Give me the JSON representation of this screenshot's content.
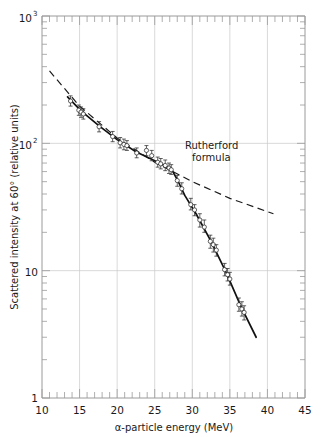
{
  "chart_data": {
    "type": "scatter",
    "title": "",
    "xlabel": "α-particle energy (MeV)",
    "ylabel": "Scattered intensity at 60° (relative units)",
    "xlim": [
      10,
      45
    ],
    "ylim": [
      1,
      1000
    ],
    "yscale": "log",
    "xscale": "linear",
    "grid": true,
    "legend_position": "none",
    "xticks": [
      10,
      15,
      20,
      25,
      30,
      35,
      40,
      45
    ],
    "xtick_labels": [
      "10",
      "15",
      "20",
      "25",
      "30",
      "35",
      "40",
      "45"
    ],
    "xminor_step": 1,
    "yticks": [
      1,
      10,
      100,
      1000
    ],
    "ytick_labels": [
      "1",
      "10",
      "10",
      "10"
    ],
    "ytick_label_parts": [
      {
        "base": "1",
        "exp": ""
      },
      {
        "base": "10",
        "exp": ""
      },
      {
        "base": "10",
        "exp": "2"
      },
      {
        "base": "10",
        "exp": "3"
      }
    ],
    "annotations": [
      {
        "name": "rutherford-formula-label",
        "text_line1": "Rutherford",
        "text_line2": "formula",
        "x": 25.6,
        "y": 78
      }
    ],
    "series": [
      {
        "name": "measured scattered intensity",
        "style": "points-with-errorbars-and-line",
        "marker": "open-circle",
        "color": "#111111",
        "points": [
          {
            "x": 13.8,
            "y": 215,
            "yerr_lo": 196,
            "yerr_hi": 236
          },
          {
            "x": 14.9,
            "y": 182,
            "yerr_lo": 166,
            "yerr_hi": 200
          },
          {
            "x": 15.2,
            "y": 176,
            "yerr_lo": 160,
            "yerr_hi": 193
          },
          {
            "x": 15.5,
            "y": 170,
            "yerr_lo": 155,
            "yerr_hi": 187
          },
          {
            "x": 17.6,
            "y": 135,
            "yerr_lo": 123,
            "yerr_hi": 148
          },
          {
            "x": 19.4,
            "y": 113,
            "yerr_lo": 103,
            "yerr_hi": 124
          },
          {
            "x": 20.4,
            "y": 101,
            "yerr_lo": 92,
            "yerr_hi": 111
          },
          {
            "x": 20.9,
            "y": 98,
            "yerr_lo": 89,
            "yerr_hi": 108
          },
          {
            "x": 21.3,
            "y": 96,
            "yerr_lo": 88,
            "yerr_hi": 105
          },
          {
            "x": 22.6,
            "y": 84,
            "yerr_lo": 77,
            "yerr_hi": 92
          },
          {
            "x": 23.9,
            "y": 88,
            "yerr_lo": 80,
            "yerr_hi": 96
          },
          {
            "x": 24.6,
            "y": 80,
            "yerr_lo": 73,
            "yerr_hi": 88
          },
          {
            "x": 25.4,
            "y": 71,
            "yerr_lo": 65,
            "yerr_hi": 78
          },
          {
            "x": 25.8,
            "y": 69,
            "yerr_lo": 63,
            "yerr_hi": 76
          },
          {
            "x": 26.4,
            "y": 67,
            "yerr_lo": 61,
            "yerr_hi": 74
          },
          {
            "x": 26.9,
            "y": 64,
            "yerr_lo": 58,
            "yerr_hi": 70
          },
          {
            "x": 27.2,
            "y": 62,
            "yerr_lo": 57,
            "yerr_hi": 68
          },
          {
            "x": 28.0,
            "y": 51,
            "yerr_lo": 46,
            "yerr_hi": 56
          },
          {
            "x": 28.6,
            "y": 44,
            "yerr_lo": 40,
            "yerr_hi": 49
          },
          {
            "x": 29.8,
            "y": 33,
            "yerr_lo": 30,
            "yerr_hi": 37
          },
          {
            "x": 30.3,
            "y": 30,
            "yerr_lo": 27,
            "yerr_hi": 33
          },
          {
            "x": 31.0,
            "y": 25,
            "yerr_lo": 22,
            "yerr_hi": 28
          },
          {
            "x": 31.6,
            "y": 22,
            "yerr_lo": 20,
            "yerr_hi": 25
          },
          {
            "x": 32.4,
            "y": 17,
            "yerr_lo": 15,
            "yerr_hi": 19
          },
          {
            "x": 32.8,
            "y": 16,
            "yerr_lo": 14,
            "yerr_hi": 18
          },
          {
            "x": 33.2,
            "y": 14.5,
            "yerr_lo": 13,
            "yerr_hi": 16
          },
          {
            "x": 34.3,
            "y": 10.2,
            "yerr_lo": 9.1,
            "yerr_hi": 11.4
          },
          {
            "x": 34.7,
            "y": 9.3,
            "yerr_lo": 8.3,
            "yerr_hi": 10.4
          },
          {
            "x": 35.0,
            "y": 8.6,
            "yerr_lo": 7.7,
            "yerr_hi": 9.7
          },
          {
            "x": 36.2,
            "y": 5.4,
            "yerr_lo": 4.8,
            "yerr_hi": 6.1
          },
          {
            "x": 36.6,
            "y": 5.0,
            "yerr_lo": 4.4,
            "yerr_hi": 5.7
          },
          {
            "x": 36.9,
            "y": 4.7,
            "yerr_lo": 4.1,
            "yerr_hi": 5.3
          }
        ],
        "fit_line": [
          {
            "x": 13.4,
            "y": 232
          },
          {
            "x": 15.2,
            "y": 180
          },
          {
            "x": 17.6,
            "y": 137
          },
          {
            "x": 20.0,
            "y": 107
          },
          {
            "x": 22.5,
            "y": 86
          },
          {
            "x": 25.0,
            "y": 73
          },
          {
            "x": 27.2,
            "y": 63
          },
          {
            "x": 28.0,
            "y": 52
          },
          {
            "x": 29.0,
            "y": 39
          },
          {
            "x": 30.5,
            "y": 28
          },
          {
            "x": 32.5,
            "y": 17
          },
          {
            "x": 34.5,
            "y": 9.7
          },
          {
            "x": 36.5,
            "y": 5.2
          },
          {
            "x": 38.5,
            "y": 3.0
          }
        ]
      },
      {
        "name": "Rutherford formula",
        "style": "dashed-line",
        "color": "#1a1a1a",
        "points": [
          {
            "x": 11.0,
            "y": 370
          },
          {
            "x": 15.0,
            "y": 196
          },
          {
            "x": 20.0,
            "y": 110
          },
          {
            "x": 25.0,
            "y": 71
          },
          {
            "x": 27.2,
            "y": 61
          },
          {
            "x": 30.0,
            "y": 50
          },
          {
            "x": 35.0,
            "y": 37
          },
          {
            "x": 40.8,
            "y": 28
          }
        ]
      }
    ]
  },
  "labels": {
    "ylabel": "Scattered intensity at 60° (relative units)",
    "xlabel_prefix": "α",
    "xlabel_rest": "-particle energy (MeV)",
    "annotation_line1": "Rutherford",
    "annotation_line2": "formula",
    "y_1": "1",
    "y_10": "10",
    "y_100_base": "10",
    "y_100_exp": "2",
    "y_1000_base": "10",
    "y_1000_exp": "3",
    "x_10": "10",
    "x_15": "15",
    "x_20": "20",
    "x_25": "25",
    "x_30": "30",
    "x_35": "35",
    "x_40": "40",
    "x_45": "45"
  },
  "colors": {
    "data": "#111111",
    "rutherford": "#1a1a1a",
    "grid": "#c9c9c9",
    "axis": "#9a9a9a",
    "background": "#ffffff"
  }
}
